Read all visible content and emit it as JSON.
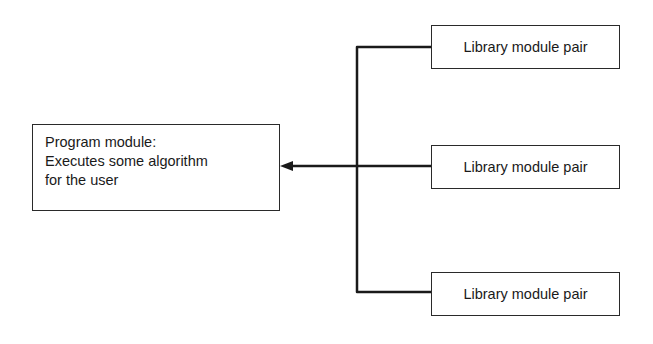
{
  "program_module": {
    "lines": [
      "Program module:",
      "Executes some algorithm",
      "for the user"
    ]
  },
  "library_modules": [
    {
      "label": "Library module pair"
    },
    {
      "label": "Library module pair"
    },
    {
      "label": "Library module pair"
    }
  ],
  "connections": {
    "bus_color": "#1a1a1a",
    "arrow_direction": "library-modules-to-program-module"
  }
}
